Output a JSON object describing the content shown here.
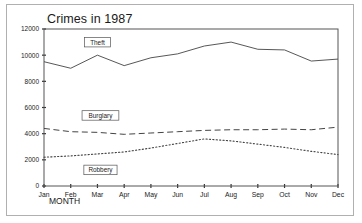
{
  "chart_data": {
    "type": "line",
    "title": "Crimes in 1987",
    "xlabel": "MONTH",
    "ylabel": "",
    "categories": [
      "Jan",
      "Feb",
      "Mar",
      "Apr",
      "May",
      "Jun",
      "Jul",
      "Aug",
      "Sep",
      "Oct",
      "Nov",
      "Dec"
    ],
    "ylim": [
      0,
      12000
    ],
    "yticks": [
      0,
      2000,
      4000,
      6000,
      8000,
      10000,
      12000
    ],
    "ytick_labels": [
      "0",
      "2000",
      "4000",
      "6000",
      "8000",
      "10000",
      "12000"
    ],
    "grid": false,
    "legend": "inline-labels",
    "series": [
      {
        "name": "Theft",
        "style": "solid",
        "values": [
          9500,
          9000,
          10000,
          9200,
          9800,
          10100,
          10700,
          11000,
          10450,
          10400,
          9550,
          9700
        ]
      },
      {
        "name": "Burglary",
        "style": "dashed",
        "values": [
          4400,
          4150,
          4100,
          3950,
          4050,
          4150,
          4250,
          4300,
          4300,
          4350,
          4300,
          4500
        ]
      },
      {
        "name": "Robbery",
        "style": "dotted",
        "values": [
          2200,
          2300,
          2450,
          2600,
          2900,
          3250,
          3600,
          3450,
          3200,
          2950,
          2650,
          2400
        ]
      }
    ],
    "annotations": [
      {
        "label": "Theft",
        "at_category": "Mar"
      },
      {
        "label": "Burglary",
        "at_category": "Mar"
      },
      {
        "label": "Robbery",
        "at_category": "Mar"
      }
    ]
  },
  "colors": {
    "frame": "#b0b0b0",
    "axis": "#555555",
    "line": "#444444",
    "text": "#1a1a1a",
    "background": "#ffffff"
  }
}
